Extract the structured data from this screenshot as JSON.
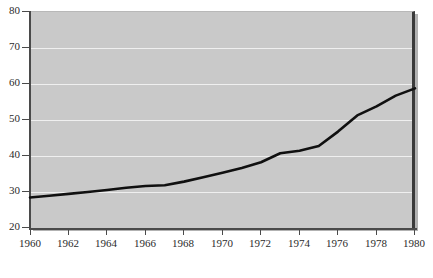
{
  "chart_data": {
    "type": "line",
    "title": "",
    "subtitle": "",
    "xlabel": "",
    "ylabel": "",
    "xlim": [
      1960,
      1980
    ],
    "ylim": [
      20,
      80
    ],
    "grid": true,
    "legend": "none",
    "x_ticks": [
      "1960",
      "1962",
      "1964",
      "1966",
      "1968",
      "1970",
      "1972",
      "1974",
      "1976",
      "1978",
      "1980"
    ],
    "y_ticks": [
      "20",
      "30",
      "40",
      "50",
      "60",
      "70",
      "80"
    ],
    "series": [
      {
        "name": "value",
        "x": [
          1960,
          1961,
          1962,
          1963,
          1964,
          1965,
          1966,
          1967,
          1968,
          1969,
          1970,
          1971,
          1972,
          1973,
          1974,
          1975,
          1976,
          1977,
          1978,
          1979,
          1980
        ],
        "values": [
          28.2,
          28.7,
          29.2,
          29.7,
          30.3,
          30.9,
          31.4,
          31.6,
          32.6,
          33.8,
          35.1,
          36.4,
          38.0,
          40.5,
          41.2,
          42.5,
          46.5,
          51.0,
          53.5,
          56.5,
          58.5
        ]
      }
    ]
  },
  "axes": {
    "y_labels": [
      "80",
      "70",
      "60",
      "50",
      "40",
      "30",
      "20"
    ],
    "x_labels": [
      "1960",
      "1962",
      "1964",
      "1966",
      "1968",
      "1970",
      "1972",
      "1974",
      "1976",
      "1978",
      "1980"
    ]
  },
  "colors": {
    "plot_background": "#c9c9c9",
    "gridline": "#efefef",
    "line": "#101010",
    "axis": "#4a4a4a",
    "page_background": "#ffffff",
    "label_text": "#2b2b2b"
  }
}
